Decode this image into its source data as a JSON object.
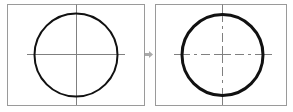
{
  "diagram": {
    "colors": {
      "background": "#ffffff",
      "frame_border": "#9a9a9a",
      "circle_stroke": "#111111",
      "center_line": "#808080",
      "arrow": "#aaaaaa"
    },
    "panels": [
      {
        "id": "before",
        "frame": {
          "x": 7,
          "y": 4,
          "width": 137,
          "height": 101
        },
        "circle": {
          "cx": 76,
          "cy": 55,
          "r": 41.5,
          "stroke_width": 2
        },
        "horizontal_line": {
          "x1": 27,
          "x2": 125,
          "y": 54,
          "style": "solid"
        },
        "vertical_line": {
          "x": 76.5,
          "y1": 4,
          "y2": 105,
          "style": "solid"
        }
      },
      {
        "id": "after",
        "frame": {
          "x": 155,
          "y": 4,
          "width": 131,
          "height": 101
        },
        "circle": {
          "cx": 222.5,
          "cy": 55,
          "r": 40.5,
          "stroke_width": 3
        },
        "horizontal_line": {
          "x1": 174,
          "x2": 272,
          "y": 54.5,
          "style": "dash-dot"
        },
        "vertical_line": {
          "x": 222.5,
          "y1": 4,
          "y2": 105,
          "style": "dash-dot",
          "solid_end_segments": [
            [
              4,
              22
            ],
            [
              88,
              105
            ]
          ]
        }
      }
    ],
    "arrow": {
      "direction": "right",
      "x": 145,
      "y": 51,
      "width": 8,
      "height": 7
    }
  }
}
